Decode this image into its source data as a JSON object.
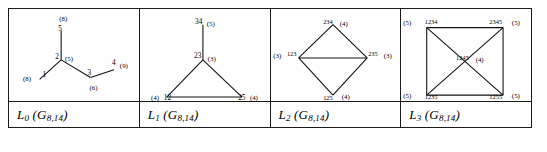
{
  "figure": {
    "kind": "line-graph-iteration-table",
    "border_color": "#1a1a1a",
    "panels": [
      {
        "id": "L0",
        "caption_main": "L",
        "caption_index": "0",
        "caption_arg_open": "(G",
        "caption_arg_sub": "8,14",
        "caption_arg_close": ")",
        "caption_text": "L0 (G8,14)",
        "graph_type": "tree",
        "nodes": [
          {
            "name": "1",
            "degree": "(8)",
            "x": 30,
            "y": 72,
            "label_dx": 3,
            "label_dy": -3,
            "deg_dx": -17,
            "deg_dy": 2
          },
          {
            "name": "2",
            "degree": "(5)",
            "x": 52,
            "y": 52,
            "label_dx": -6,
            "label_dy": -1,
            "deg_dx": 4,
            "deg_dy": 1
          },
          {
            "name": "3",
            "degree": "(6)",
            "x": 82,
            "y": 70,
            "label_dx": -3,
            "label_dy": -3,
            "deg_dx": -1,
            "deg_dy": 13
          },
          {
            "name": "4",
            "degree": "(9)",
            "x": 106,
            "y": 62,
            "label_dx": -2,
            "label_dy": -5,
            "deg_dx": 6,
            "deg_dy": -2
          },
          {
            "name": "5",
            "degree": "(8)",
            "x": 52,
            "y": 22,
            "label_dx": -3,
            "label_dy": 0,
            "deg_dx": -2,
            "deg_dy": -10
          }
        ],
        "edges": [
          [
            1,
            0
          ],
          [
            1,
            4
          ],
          [
            1,
            2
          ],
          [
            2,
            3
          ]
        ]
      },
      {
        "id": "L1",
        "caption_main": "L",
        "caption_index": "1",
        "caption_arg_open": "(G",
        "caption_arg_sub": "8,14",
        "caption_arg_close": ")",
        "caption_text": "L1 (G8,14)",
        "graph_type": "triangle-with-pendant",
        "nodes": [
          {
            "name": "34",
            "degree": "(5)",
            "x": 63,
            "y": 16,
            "label_dx": -8,
            "label_dy": -1,
            "deg_dx": 4,
            "deg_dy": 1
          },
          {
            "name": "23",
            "degree": "(3)",
            "x": 63,
            "y": 52,
            "label_dx": -9,
            "label_dy": -2,
            "deg_dx": 5,
            "deg_dy": 1
          },
          {
            "name": "12",
            "degree": "(4)",
            "x": 26,
            "y": 90,
            "label_dx": -3,
            "label_dy": 3,
            "deg_dx": -16,
            "deg_dy": 3
          },
          {
            "name": "25",
            "degree": "(4)",
            "x": 103,
            "y": 90,
            "label_dx": -4,
            "label_dy": 3,
            "deg_dx": 8,
            "deg_dy": 3
          }
        ],
        "edges": [
          [
            0,
            1
          ],
          [
            1,
            2
          ],
          [
            1,
            3
          ],
          [
            2,
            3
          ]
        ]
      },
      {
        "id": "L2",
        "caption_main": "L",
        "caption_index": "2",
        "caption_arg_open": "(G",
        "caption_arg_sub": "8,14",
        "caption_arg_close": ")",
        "caption_text": "L2 (G8,14)",
        "graph_type": "diamond",
        "nodes": [
          {
            "name": "234",
            "degree": "(4)",
            "x": 62,
            "y": 16,
            "label_dx": -10,
            "label_dy": -1,
            "deg_dx": 7,
            "deg_dy": 1
          },
          {
            "name": "123",
            "degree": "(3)",
            "x": 27,
            "y": 50,
            "label_dx": -12,
            "label_dy": -2,
            "deg_dx": -26,
            "deg_dy": 0
          },
          {
            "name": "235",
            "degree": "(3)",
            "x": 97,
            "y": 50,
            "label_dx": 1,
            "label_dy": -2,
            "deg_dx": 17,
            "deg_dy": 0
          },
          {
            "name": "125",
            "degree": "(4)",
            "x": 62,
            "y": 88,
            "label_dx": -10,
            "label_dy": 5,
            "deg_dx": 9,
            "deg_dy": 4
          }
        ],
        "edges": [
          [
            0,
            1
          ],
          [
            0,
            2
          ],
          [
            1,
            2
          ],
          [
            1,
            3
          ],
          [
            2,
            3
          ]
        ]
      },
      {
        "id": "L3",
        "caption_main": "L",
        "caption_index": "3",
        "caption_arg_open": "(G",
        "caption_arg_sub": "8,14",
        "caption_arg_close": ")",
        "caption_text": "L3 (G8,14)",
        "graph_type": "square-with-diagonals",
        "nodes": [
          {
            "name": "1234",
            "degree": "(5)",
            "x": 25,
            "y": 19,
            "label_dx": -2,
            "label_dy": -4,
            "deg_dx": -24,
            "deg_dy": -3
          },
          {
            "name": "2345",
            "degree": "(5)",
            "x": 103,
            "y": 19,
            "label_dx": -14,
            "label_dy": -4,
            "deg_dx": 9,
            "deg_dy": -3
          },
          {
            "name": "1235",
            "degree": "(5)",
            "x": 25,
            "y": 88,
            "label_dx": -2,
            "label_dy": 4,
            "deg_dx": -24,
            "deg_dy": 3
          },
          {
            "name": "1255",
            "degree": "(5)",
            "x": 103,
            "y": 88,
            "label_dx": -14,
            "label_dy": 4,
            "deg_dx": 9,
            "deg_dy": 3
          },
          {
            "name": "1245",
            "degree": "(4)",
            "x": 64,
            "y": 53,
            "label_dx": -9,
            "label_dy": -1,
            "deg_dx": 11,
            "deg_dy": 1
          }
        ],
        "edges": [
          [
            0,
            1
          ],
          [
            0,
            2
          ],
          [
            1,
            3
          ],
          [
            2,
            3
          ],
          [
            0,
            3
          ],
          [
            1,
            2
          ]
        ]
      }
    ]
  }
}
